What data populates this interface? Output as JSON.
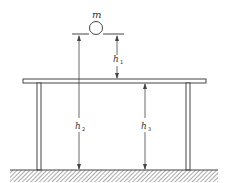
{
  "diagram": {
    "mass_label": "m",
    "heights": [
      {
        "symbol": "h",
        "subscript": "1"
      },
      {
        "symbol": "h",
        "subscript": "2"
      },
      {
        "symbol": "h",
        "subscript": "3"
      }
    ],
    "colors": {
      "line": "#444444",
      "background": "#ffffff"
    }
  }
}
